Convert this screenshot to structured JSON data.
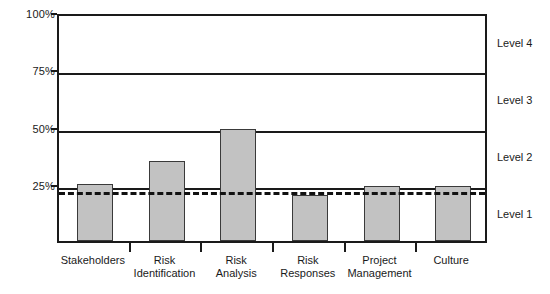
{
  "chart_data": {
    "type": "bar",
    "title": "",
    "subtitle": "",
    "xlabel": "",
    "ylabel": "",
    "ylim": [
      0,
      100
    ],
    "grid": true,
    "legend_position": "none",
    "categories": [
      "Stakeholders",
      "Risk\nIdentification",
      "Risk\nAnalysis",
      "Risk\nResponses",
      "Project\nManagement",
      "Culture"
    ],
    "values": [
      25,
      35,
      49,
      20,
      24,
      24
    ],
    "value_unit": "%",
    "y_ticks": [
      25,
      50,
      75,
      100
    ],
    "y_tick_labels": [
      "25%",
      "50%",
      "75%",
      "100%"
    ],
    "gridline_values": [
      25,
      50,
      75
    ],
    "annotations": [
      {
        "name": "threshold-line",
        "type": "dashed-horizontal-line",
        "value": 23,
        "label": ""
      }
    ],
    "bands": [
      {
        "label": "Level 1",
        "from": 0,
        "to": 25
      },
      {
        "label": "Level 2",
        "from": 25,
        "to": 50
      },
      {
        "label": "Level 3",
        "from": 50,
        "to": 75
      },
      {
        "label": "Level 4",
        "from": 75,
        "to": 100
      }
    ],
    "colors": {
      "bar_fill": "#c2c2c2",
      "bar_border": "#3a3a3a",
      "axis": "#1a1a1a",
      "gridline": "#1a1a1a",
      "threshold": "#111111",
      "background": "#ffffff",
      "text": "#1a1a1a"
    }
  }
}
